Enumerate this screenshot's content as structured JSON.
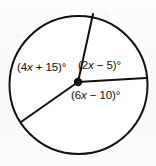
{
  "figure": {
    "type": "circle-with-central-angles",
    "background_color": "#fbfbfb",
    "stroke_color": "#111111",
    "circle": {
      "cx": 78.5,
      "cy": 85,
      "r": 69
    },
    "vertex": {
      "cx": 78,
      "cy": 82,
      "r": 4.2,
      "name": "center-point"
    },
    "radii": [
      {
        "name": "radius-up",
        "x1": 78,
        "y1": 82,
        "x2": 93,
        "y2": 14
      },
      {
        "name": "radius-right",
        "x1": 78,
        "y1": 82,
        "x2": 146,
        "y2": 78
      },
      {
        "name": "radius-lower-left",
        "x1": 78,
        "y1": 82,
        "x2": 21,
        "y2": 122
      }
    ],
    "labels": {
      "left": {
        "prefix": "(4",
        "var": "x",
        "suffix": " + 15)°",
        "full": "(4x + 15)°"
      },
      "upper_right": {
        "prefix": "(2",
        "var": "x",
        "suffix": " − 5)°",
        "full": "(2x − 5)°"
      },
      "lower_right": {
        "prefix": "(6",
        "var": "x",
        "suffix": " − 10)°",
        "full": "(6x − 10)°"
      }
    }
  },
  "chart_data": {
    "type": "pie",
    "title": "",
    "xlabel": "",
    "ylabel": "",
    "categories": [
      "(4x + 15)°",
      "(2x − 5)°",
      "(6x − 10)°"
    ],
    "values": [
      145,
      75,
      140
    ],
    "labels": [
      "(4x + 15)°",
      "(2x − 5)°",
      "(6x − 10)°"
    ],
    "legend": "none",
    "grid": false
  }
}
